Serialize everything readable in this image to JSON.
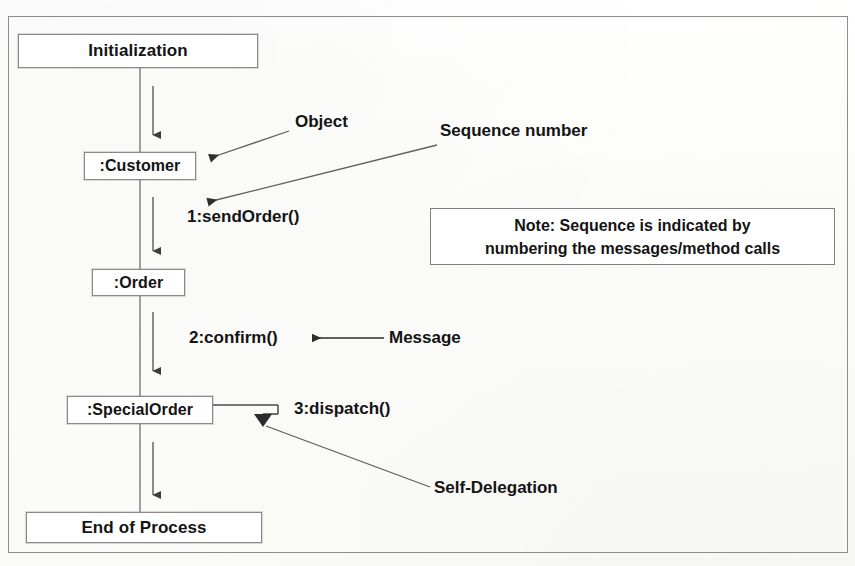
{
  "diagram": {
    "kind": "uml-sequence-diagram",
    "lifeline_x": 140,
    "stroke_color": "#4a4a4a",
    "text_color": "#141414",
    "frame_color": "#8d8d8d",
    "nodes": [
      {
        "id": "initialization",
        "label": "Initialization",
        "x": 18,
        "y": 34,
        "w": 240,
        "h": 34
      },
      {
        "id": "customer",
        "label": ":Customer",
        "x": 84,
        "y": 152,
        "w": 112,
        "h": 28
      },
      {
        "id": "order",
        "label": ":Order",
        "x": 92,
        "y": 269,
        "w": 93,
        "h": 27
      },
      {
        "id": "specialorder",
        "label": ":SpecialOrder",
        "x": 67,
        "y": 396,
        "w": 146,
        "h": 28
      },
      {
        "id": "endofprocess",
        "label": "End of Process",
        "x": 26,
        "y": 512,
        "w": 236,
        "h": 31
      }
    ],
    "messages": [
      {
        "id": "sendorder",
        "sequence": "1",
        "name": "sendOrder()",
        "label": "1:sendOrder()",
        "from": "customer",
        "to": "order"
      },
      {
        "id": "confirm",
        "sequence": "2",
        "name": "confirm()",
        "label": "2:confirm()",
        "from": "order",
        "to": "specialorder"
      },
      {
        "id": "dispatch",
        "sequence": "3",
        "name": "dispatch()",
        "label": "3:dispatch()",
        "from": "specialorder",
        "to": "specialorder",
        "self_delegation": true
      }
    ],
    "annotations": [
      {
        "id": "object",
        "label": "Object",
        "points_to": "customer"
      },
      {
        "id": "sequence-number",
        "label": "Sequence number",
        "points_to": "sendorder"
      },
      {
        "id": "message",
        "label": "Message",
        "points_to": "confirm"
      },
      {
        "id": "self-delegation",
        "label": "Self-Delegation",
        "points_to": "dispatch"
      }
    ],
    "note": {
      "id": "sequence-note",
      "line1": "Note: Sequence is indicated by",
      "line2": "numbering the messages/method calls",
      "x": 430,
      "y": 208,
      "w": 405,
      "h": 57
    }
  }
}
